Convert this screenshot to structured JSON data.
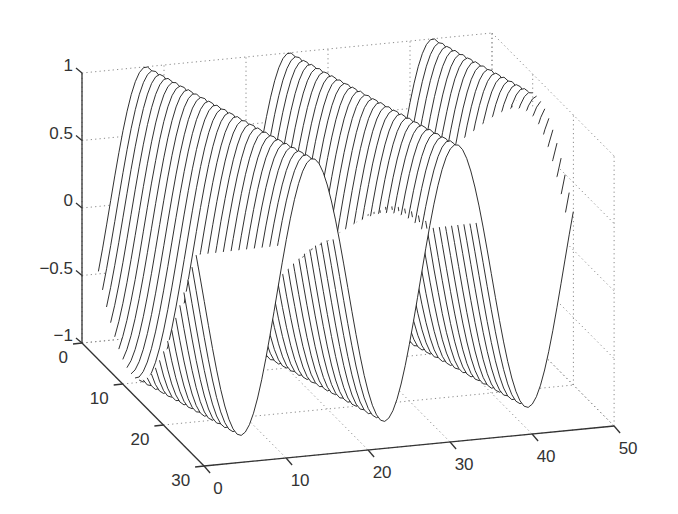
{
  "chart_data": {
    "type": "mesh3d",
    "title": "",
    "xlabel": "",
    "ylabel": "",
    "zlabel": "",
    "function": "z = sin(2*pi*(x - 3.4 - 0.35*y) / 17.5)",
    "x": {
      "min": 2,
      "max": 48,
      "step": 0.5
    },
    "y": {
      "min": 0,
      "max": 24,
      "step": 1
    },
    "xlim": [
      0,
      50
    ],
    "ylim": [
      0,
      30
    ],
    "zlim": [
      -1,
      1
    ],
    "grid": true,
    "x_ticks": [
      {
        "value": 0,
        "label": "0"
      },
      {
        "value": 10,
        "label": "10"
      },
      {
        "value": 20,
        "label": "20"
      },
      {
        "value": 30,
        "label": "30"
      },
      {
        "value": 40,
        "label": "40"
      },
      {
        "value": 50,
        "label": "50"
      }
    ],
    "y_ticks": [
      {
        "value": 0,
        "label": "0"
      },
      {
        "value": 10,
        "label": "10"
      },
      {
        "value": 20,
        "label": "20"
      },
      {
        "value": 30,
        "label": "30"
      }
    ],
    "z_ticks": [
      {
        "value": 1,
        "label": "1"
      },
      {
        "value": 0.5,
        "label": "0.5"
      },
      {
        "value": 0,
        "label": "0"
      },
      {
        "value": -0.5,
        "label": "−0.5"
      },
      {
        "value": -1,
        "label": "−1"
      }
    ]
  }
}
